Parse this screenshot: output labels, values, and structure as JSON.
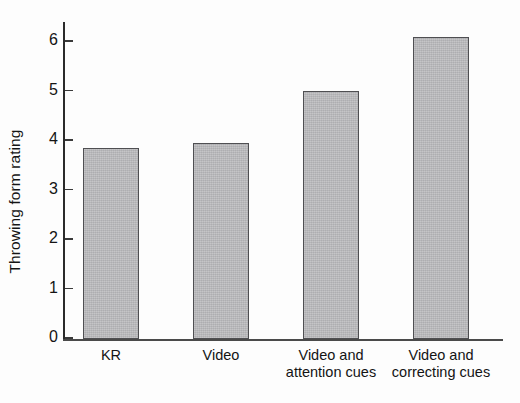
{
  "chart_data": {
    "type": "bar",
    "title": "",
    "xlabel": "",
    "ylabel": "Throwing form rating",
    "categories": [
      "KR",
      "Video",
      "Video and\nattention cues",
      "Video and\ncorrecting cues"
    ],
    "values": [
      3.85,
      3.95,
      5.0,
      6.1
    ],
    "ylim": [
      0,
      6.4
    ],
    "yticks": [
      0,
      1,
      2,
      3,
      4,
      5,
      6
    ],
    "ytick_labels": [
      "0",
      "1",
      "2",
      "3",
      "4",
      "5",
      "6"
    ],
    "grid": false,
    "legend": null,
    "bar_color": "#b9b9bc",
    "bar_edge_color": "#4f4f52",
    "background_color": "#fdfdfd",
    "axis_color": "#2b2b2b"
  }
}
